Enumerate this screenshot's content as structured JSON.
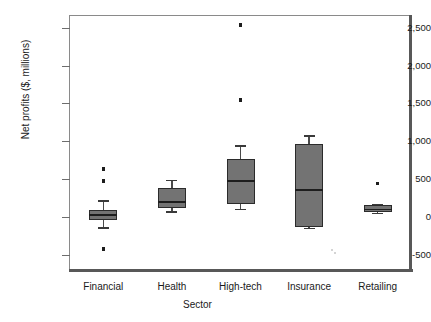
{
  "chart_data": {
    "type": "box",
    "title": "",
    "xlabel": "Sector",
    "ylabel": "Net profits ($, millions)",
    "categories": [
      "Financial",
      "Health",
      "High-tech",
      "Insurance",
      "Retailing"
    ],
    "ylim": [
      -800,
      2800
    ],
    "yticks": [
      -500,
      0,
      500,
      1000,
      1500,
      2000,
      2500
    ],
    "ytick_labels": [
      "-500",
      "0",
      "500",
      "1,000",
      "1,500",
      "2,000",
      "2,500"
    ],
    "grid": false,
    "legend": "none",
    "boxes": [
      {
        "category": "Financial",
        "whisker_low": -140,
        "q1": -40,
        "median": 30,
        "q3": 95,
        "whisker_high": 215,
        "outliers": [
          630,
          470,
          -425
        ]
      },
      {
        "category": "Health",
        "whisker_low": 70,
        "q1": 120,
        "median": 205,
        "q3": 375,
        "whisker_high": 490,
        "outliers": []
      },
      {
        "category": "High-tech",
        "whisker_low": 105,
        "q1": 165,
        "median": 480,
        "q3": 760,
        "whisker_high": 945,
        "outliers": [
          2535,
          1545
        ]
      },
      {
        "category": "Insurance",
        "whisker_low": -145,
        "q1": -130,
        "median": 360,
        "q3": 960,
        "whisker_high": 1075,
        "outliers": []
      },
      {
        "category": "Retailing",
        "whisker_low": 55,
        "q1": 60,
        "median": 105,
        "q3": 160,
        "whisker_high": 165,
        "outliers": [
          440
        ]
      }
    ],
    "colors": {
      "box_fill": "#737373",
      "box_edge": "#2b2b2b",
      "median": "#1d1d1d",
      "whisker": "#4a4a4a",
      "outlier": "#1d1d1d",
      "frame": "#8a8a8a",
      "axis_heavy": "#585858",
      "background": "#ffffff",
      "text": "#1a1a1a"
    }
  }
}
